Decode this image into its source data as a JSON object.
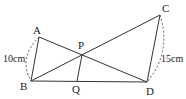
{
  "diagram": {
    "points": {
      "A": {
        "label": "A",
        "x": 39,
        "y": 37
      },
      "B": {
        "label": "B",
        "x": 31,
        "y": 81
      },
      "C": {
        "label": "C",
        "x": 160,
        "y": 15
      },
      "D": {
        "label": "D",
        "x": 147,
        "y": 82
      },
      "P": {
        "label": "P",
        "x": 82,
        "y": 55
      },
      "Q": {
        "label": "Q",
        "x": 77,
        "y": 81
      }
    },
    "segments": [
      "AB",
      "AD",
      "BC",
      "CD",
      "BD",
      "PQ"
    ],
    "measurements": {
      "AB": "10cm",
      "CD": "15cm"
    }
  }
}
